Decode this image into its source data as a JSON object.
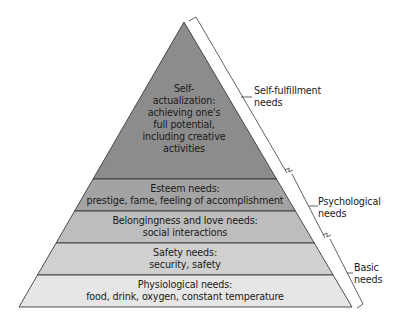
{
  "diagram": {
    "type": "pyramid",
    "colors": {
      "level_5": "#8c8c8c",
      "level_4": "#a3a3a3",
      "level_3": "#bdbdbd",
      "level_2": "#d0d0d0",
      "level_1": "#e6e6e6",
      "outline": "#3a3a3a"
    },
    "levels": [
      {
        "id": "self-actualization",
        "lines": [
          "Self-",
          "actualization:",
          "achieving one's",
          "full potential,",
          "including creative",
          "activities"
        ]
      },
      {
        "id": "esteem",
        "lines": [
          "Esteem needs:",
          "prestige, fame, feeling of accomplishment"
        ]
      },
      {
        "id": "belongingness",
        "lines": [
          "Belongingness and love needs:",
          "social interactions"
        ]
      },
      {
        "id": "safety",
        "lines": [
          "Safety needs:",
          "security, safety"
        ]
      },
      {
        "id": "physiological",
        "lines": [
          "Physiological needs:",
          "food, drink, oxygen, constant temperature"
        ]
      }
    ],
    "groups": [
      {
        "id": "self-fulfillment",
        "lines": [
          "Self-fulfillment",
          "needs"
        ]
      },
      {
        "id": "psychological",
        "lines": [
          "Psychological",
          "needs"
        ]
      },
      {
        "id": "basic",
        "lines": [
          "Basic",
          "needs"
        ]
      }
    ]
  }
}
